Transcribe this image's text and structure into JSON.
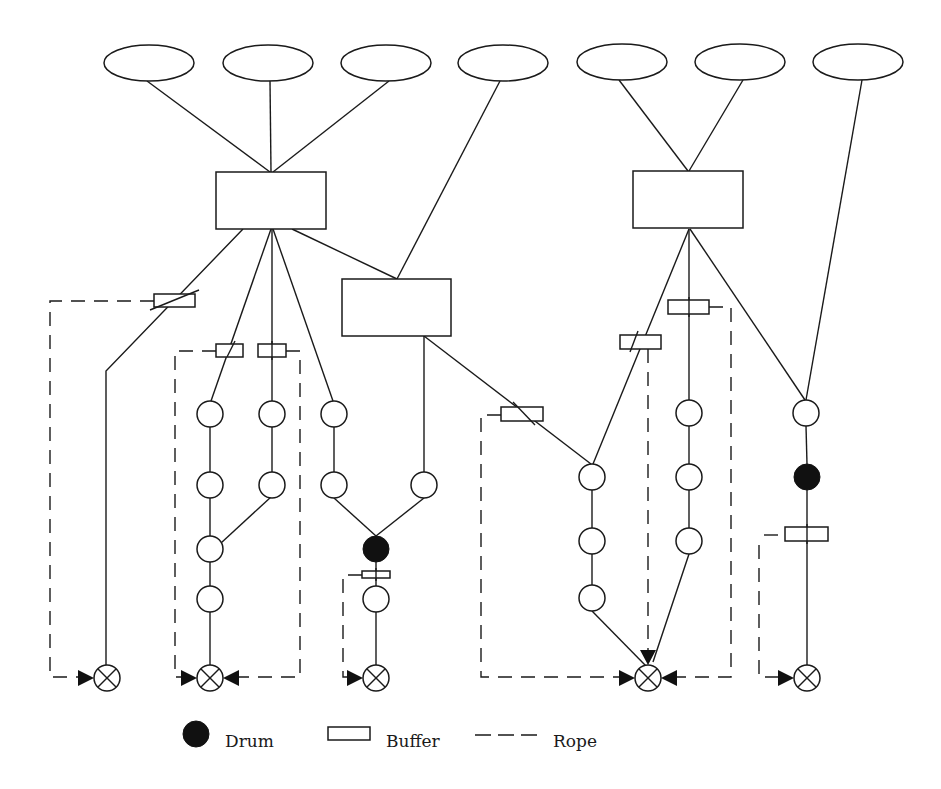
{
  "diagram": {
    "type": "drum-buffer-rope network",
    "colors": {
      "stroke": "#1a1a1a",
      "drum": "#111111",
      "background": "#ffffff"
    },
    "ellipses": [
      {
        "id": "e1",
        "cx": 149,
        "cy": 63,
        "rx": 45,
        "ry": 18
      },
      {
        "id": "e2",
        "cx": 268,
        "cy": 63,
        "rx": 45,
        "ry": 18
      },
      {
        "id": "e3",
        "cx": 386,
        "cy": 63,
        "rx": 45,
        "ry": 18
      },
      {
        "id": "e4",
        "cx": 503,
        "cy": 63,
        "rx": 45,
        "ry": 18
      },
      {
        "id": "e5",
        "cx": 622,
        "cy": 62,
        "rx": 45,
        "ry": 18
      },
      {
        "id": "e6",
        "cx": 740,
        "cy": 62,
        "rx": 45,
        "ry": 18
      },
      {
        "id": "e7",
        "cx": 858,
        "cy": 62,
        "rx": 45,
        "ry": 18
      }
    ],
    "boxes": [
      {
        "id": "box1",
        "x": 216,
        "y": 172,
        "w": 110,
        "h": 57
      },
      {
        "id": "box2",
        "x": 633,
        "y": 171,
        "w": 110,
        "h": 57
      },
      {
        "id": "box3",
        "x": 342,
        "y": 279,
        "w": 109,
        "h": 57
      }
    ],
    "buffers": [
      {
        "id": "bufA",
        "x": 154,
        "y": 294,
        "w": 41,
        "h": 13
      },
      {
        "id": "bufB",
        "x": 216,
        "y": 344,
        "w": 27,
        "h": 13
      },
      {
        "id": "bufC",
        "x": 258,
        "y": 344,
        "w": 28,
        "h": 13
      },
      {
        "id": "bufD",
        "x": 620,
        "y": 335,
        "w": 41,
        "h": 14
      },
      {
        "id": "bufE",
        "x": 668,
        "y": 300,
        "w": 41,
        "h": 14
      },
      {
        "id": "bufF",
        "x": 501,
        "y": 407,
        "w": 42,
        "h": 14
      },
      {
        "id": "bufG",
        "x": 785,
        "y": 527,
        "w": 43,
        "h": 14
      },
      {
        "id": "bufH",
        "x": 362,
        "y": 571,
        "w": 28,
        "h": 7
      }
    ],
    "operations": [
      {
        "cx": 210,
        "cy": 414
      },
      {
        "cx": 210,
        "cy": 485
      },
      {
        "cx": 210,
        "cy": 549
      },
      {
        "cx": 210,
        "cy": 599
      },
      {
        "cx": 272,
        "cy": 414
      },
      {
        "cx": 272,
        "cy": 485
      },
      {
        "cx": 334,
        "cy": 414
      },
      {
        "cx": 334,
        "cy": 485
      },
      {
        "cx": 424,
        "cy": 485
      },
      {
        "cx": 376,
        "cy": 599
      },
      {
        "cx": 592,
        "cy": 477
      },
      {
        "cx": 592,
        "cy": 541
      },
      {
        "cx": 592,
        "cy": 598
      },
      {
        "cx": 689,
        "cy": 413
      },
      {
        "cx": 689,
        "cy": 477
      },
      {
        "cx": 689,
        "cy": 541
      },
      {
        "cx": 806,
        "cy": 413
      }
    ],
    "drums": [
      {
        "cx": 376,
        "cy": 549
      },
      {
        "cx": 807,
        "cy": 477
      }
    ],
    "shipping_points": [
      {
        "cx": 107,
        "cy": 678
      },
      {
        "cx": 210,
        "cy": 678
      },
      {
        "cx": 376,
        "cy": 678
      },
      {
        "cx": 648,
        "cy": 678
      },
      {
        "cx": 807,
        "cy": 678
      }
    ]
  },
  "legend": {
    "drum_label": "Drum",
    "buffer_label": "Buffer",
    "rope_label": "Rope"
  }
}
